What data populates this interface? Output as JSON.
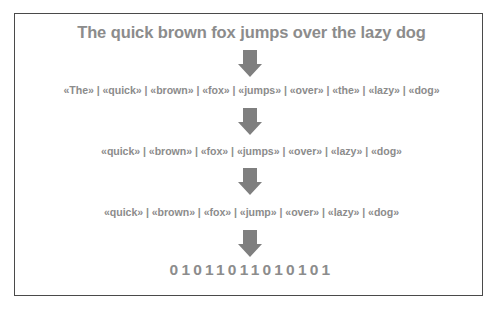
{
  "diagram": {
    "title": "The quick brown fox jumps over the lazy dog",
    "steps": [
      {
        "label": "«The» | «quick» | «brown» | «fox» | «jumps» | «over» | «the» | «lazy» | «dog»",
        "tokens": [
          "«The»",
          "«quick»",
          "«brown»",
          "«fox»",
          "«jumps»",
          "«over»",
          "«the»",
          "«lazy»",
          "«dog»"
        ]
      },
      {
        "label": "«quick» | «brown» | «fox» | «jumps» | «over» | «lazy» | «dog»",
        "tokens": [
          "«quick»",
          "«brown»",
          "«fox»",
          "«jumps»",
          "«over»",
          "«lazy»",
          "«dog»"
        ]
      },
      {
        "label": "«quick» | «brown» | «fox» | «jump» | «over» | «lazy» | «dog»",
        "tokens": [
          "«quick»",
          "«brown»",
          "«fox»",
          "«jump»",
          "«over»",
          "«lazy»",
          "«dog»"
        ]
      }
    ],
    "binary": "01011011010101",
    "arrows": [
      "down-arrow-icon",
      "down-arrow-icon",
      "down-arrow-icon",
      "down-arrow-icon"
    ],
    "colors": {
      "text": "#8c8c8c",
      "arrow": "#7f7f7f",
      "border": "#4a4a4a"
    }
  }
}
